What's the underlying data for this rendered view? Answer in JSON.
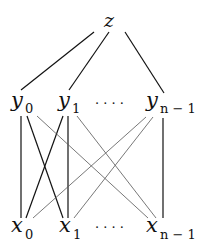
{
  "diagram": {
    "type": "layered-graph",
    "colors": {
      "background": "#ffffff",
      "strong_edge": "#111111",
      "light_edge": "#555555",
      "text": "#111111"
    },
    "nodes": {
      "top": {
        "id": "z",
        "var": "z",
        "sub": ""
      },
      "middle": [
        {
          "id": "y0",
          "var": "y",
          "sub": "0"
        },
        {
          "id": "y1",
          "var": "y",
          "sub": "1"
        },
        {
          "id": "yn-1",
          "var": "y",
          "sub": "n − 1"
        }
      ],
      "bottom": [
        {
          "id": "x0",
          "var": "x",
          "sub": "0"
        },
        {
          "id": "x1",
          "var": "x",
          "sub": "1"
        },
        {
          "id": "xn-1",
          "var": "x",
          "sub": "n − 1"
        }
      ],
      "ellipsis": "· · · ·"
    },
    "edges": [
      {
        "from": "z",
        "to": "y0",
        "style": "strong"
      },
      {
        "from": "z",
        "to": "y1",
        "style": "strong"
      },
      {
        "from": "z",
        "to": "yn-1",
        "style": "strong"
      },
      {
        "from": "y0",
        "to": "x0",
        "style": "strong"
      },
      {
        "from": "y0",
        "to": "x1",
        "style": "strong"
      },
      {
        "from": "y0",
        "to": "xn-1",
        "style": "light"
      },
      {
        "from": "y1",
        "to": "x0",
        "style": "strong"
      },
      {
        "from": "y1",
        "to": "x1",
        "style": "strong"
      },
      {
        "from": "y1",
        "to": "xn-1",
        "style": "light"
      },
      {
        "from": "yn-1",
        "to": "x0",
        "style": "light"
      },
      {
        "from": "yn-1",
        "to": "x1",
        "style": "light"
      },
      {
        "from": "yn-1",
        "to": "xn-1",
        "style": "strong"
      }
    ]
  }
}
